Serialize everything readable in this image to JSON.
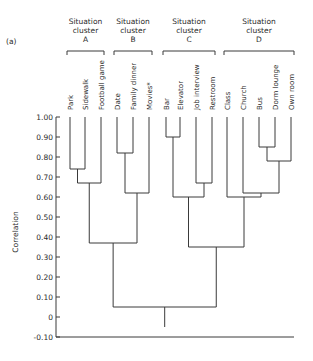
{
  "chart_data": {
    "type": "dendrogram",
    "panel_label": "(a)",
    "ylabel": "Correlation",
    "ylim": [
      -0.1,
      1.0
    ],
    "yticks": [
      1.0,
      0.9,
      0.8,
      0.7,
      0.6,
      0.5,
      0.4,
      0.3,
      0.2,
      0.1,
      0,
      -0.1
    ],
    "ytick_labels": [
      "1.00",
      "0.90",
      "0.80",
      "0.70",
      "0.60",
      "0.50",
      "0.40",
      "0.30",
      "0.20",
      "0.10",
      "0",
      "-0.10"
    ],
    "clusters": [
      {
        "title": [
          "Situation",
          "cluster",
          "A"
        ],
        "leaves": [
          "Park",
          "Sidewalk",
          "Football game"
        ]
      },
      {
        "title": [
          "Situation",
          "cluster",
          "B"
        ],
        "leaves": [
          "Date",
          "Family dinner",
          "Movies"
        ]
      },
      {
        "title": [
          "Situation",
          "cluster",
          "C"
        ],
        "leaves": [
          "Bar",
          "Elevator",
          "Job interview",
          "Restroom"
        ]
      },
      {
        "title": [
          "Situation",
          "cluster",
          "D"
        ],
        "leaves": [
          "Class",
          "Church",
          "Bus",
          "Dorm lounge",
          "Own room"
        ]
      }
    ],
    "leaves": [
      "Park",
      "Sidewalk",
      "Football game",
      "Date",
      "Family dinner",
      "Movies",
      "Bar",
      "Elevator",
      "Job interview",
      "Restroom",
      "Class",
      "Church",
      "Bus",
      "Dorm lounge",
      "Own room"
    ],
    "leaf_annotation": {
      "Movies": "*"
    },
    "merges": [
      {
        "id": "m1",
        "left": "Park",
        "right": "Sidewalk",
        "height": 0.74
      },
      {
        "id": "m2",
        "left": "m1",
        "right": "Football game",
        "height": 0.67
      },
      {
        "id": "m3",
        "left": "Date",
        "right": "Family dinner",
        "height": 0.82
      },
      {
        "id": "m4",
        "left": "m3",
        "right": "Movies",
        "height": 0.62
      },
      {
        "id": "m5",
        "left": "Bar",
        "right": "Elevator",
        "height": 0.9
      },
      {
        "id": "m6",
        "left": "Job interview",
        "right": "Restroom",
        "height": 0.67
      },
      {
        "id": "m7",
        "left": "m5",
        "right": "m6",
        "height": 0.6
      },
      {
        "id": "m8",
        "left": "Bus",
        "right": "Dorm lounge",
        "height": 0.85
      },
      {
        "id": "m9",
        "left": "m8",
        "right": "Own room",
        "height": 0.78
      },
      {
        "id": "m10",
        "left": "Church",
        "right": "m9",
        "height": 0.62
      },
      {
        "id": "m11",
        "left": "Class",
        "right": "m10",
        "height": 0.6
      },
      {
        "id": "m12",
        "left": "m2",
        "right": "m4",
        "height": 0.37
      },
      {
        "id": "m13",
        "left": "m7",
        "right": "m11",
        "height": 0.35
      },
      {
        "id": "m14",
        "left": "m12",
        "right": "m13",
        "height": 0.05
      }
    ],
    "root_stem_to": -0.05
  }
}
